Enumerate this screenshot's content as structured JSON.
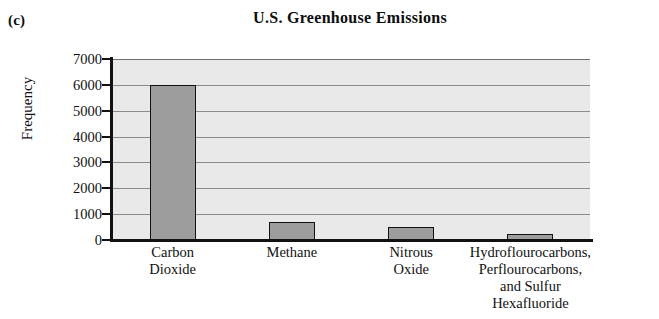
{
  "panel": {
    "label": "(c)"
  },
  "chart_data": {
    "type": "bar",
    "title": "U.S. Greenhouse Emissions",
    "xlabel": "",
    "ylabel": "Frequency",
    "ylim": [
      0,
      7000
    ],
    "ytick_labels": [
      "7000",
      "6000",
      "5000",
      "4000",
      "3000",
      "2000",
      "1000",
      "0"
    ],
    "yticks": [
      7000,
      6000,
      5000,
      4000,
      3000,
      2000,
      1000,
      0
    ],
    "grid": true,
    "legend": "none",
    "categories": [
      "Carbon Dioxide",
      "Methane",
      "Nitrous Oxide",
      "Hydroflourocarbons, Perflourocarbons, and Sulfur Hexafluoride"
    ],
    "category_lines": [
      [
        "Carbon",
        "Dioxide"
      ],
      [
        "Methane"
      ],
      [
        "Nitrous",
        "Oxide"
      ],
      [
        "Hydroflourocarbons,",
        "Perflourocarbons,",
        "and Sulfur",
        "Hexafluoride"
      ]
    ],
    "values": [
      6000,
      700,
      500,
      250
    ],
    "bar_color": "#9d9d9d",
    "bar_edge_color": "#111111",
    "plot_background": "#e9e9e9"
  }
}
